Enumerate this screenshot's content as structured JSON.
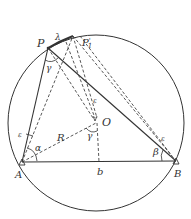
{
  "diagram": {
    "labels": {
      "P": "P",
      "lambda": "λ",
      "P1": "P",
      "P1_sup": "'",
      "P1_sub": "1",
      "gamma_top": "γ",
      "epsilon_mid": "ε",
      "O": "O",
      "gamma_center": "γ",
      "R": "R",
      "epsilon_left": "ε",
      "alpha": "α",
      "A": "A",
      "b": "b",
      "epsilon_right": "ε",
      "beta": "β",
      "B": "B"
    },
    "colors": {
      "stroke": "#333333",
      "background": "#ffffff"
    }
  }
}
